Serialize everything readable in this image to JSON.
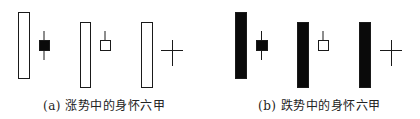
{
  "chart_data": {
    "type": "diagram",
    "panels": [
      {
        "label": "(a) 涨势中的身怀六甲",
        "trend": "uptrend",
        "patterns": [
          {
            "large_candle": {
              "color": "white",
              "x": 18,
              "y": 12,
              "w": 11,
              "h": 66
            },
            "small_candle": {
              "type": "body",
              "color": "black",
              "x": 39,
              "y": 40,
              "w": 10,
              "h": 10,
              "wick_top": 31,
              "wick_bottom": 60
            }
          },
          {
            "large_candle": {
              "color": "white",
              "x": 80,
              "y": 22,
              "w": 10,
              "h": 65
            },
            "small_candle": {
              "type": "body",
              "color": "white",
              "x": 100,
              "y": 40,
              "w": 10,
              "h": 10,
              "wick_top": 31,
              "wick_bottom": 50
            }
          },
          {
            "large_candle": {
              "color": "white",
              "x": 141,
              "y": 22,
              "w": 11,
              "h": 65
            },
            "small_candle": {
              "type": "doji",
              "cx": 172,
              "cy": 50,
              "half_w": 11,
              "top": 40,
              "bottom": 66
            }
          }
        ]
      },
      {
        "label": "(b) 跌势中的身怀六甲",
        "trend": "downtrend",
        "patterns": [
          {
            "large_candle": {
              "color": "black",
              "x": 235,
              "y": 12,
              "w": 11,
              "h": 66
            },
            "small_candle": {
              "type": "body",
              "color": "black",
              "x": 256,
              "y": 40,
              "w": 11,
              "h": 10,
              "wick_top": 31,
              "wick_bottom": 60
            }
          },
          {
            "large_candle": {
              "color": "black",
              "x": 297,
              "y": 22,
              "w": 11,
              "h": 65
            },
            "small_candle": {
              "type": "body",
              "color": "white",
              "x": 318,
              "y": 40,
              "w": 10,
              "h": 10,
              "wick_top": 31,
              "wick_bottom": 50
            }
          },
          {
            "large_candle": {
              "color": "black",
              "x": 359,
              "y": 22,
              "w": 11,
              "h": 65
            },
            "small_candle": {
              "type": "doji",
              "cx": 391,
              "cy": 50,
              "half_w": 11,
              "top": 40,
              "bottom": 66
            }
          }
        ]
      }
    ]
  },
  "captions": {
    "a": "(a) 涨势中的身怀六甲",
    "b": "(b) 跌势中的身怀六甲"
  },
  "colors": {
    "stroke": "#1a1a1a",
    "fill_black": "#0a0a0a",
    "fill_white": "#ffffff"
  }
}
